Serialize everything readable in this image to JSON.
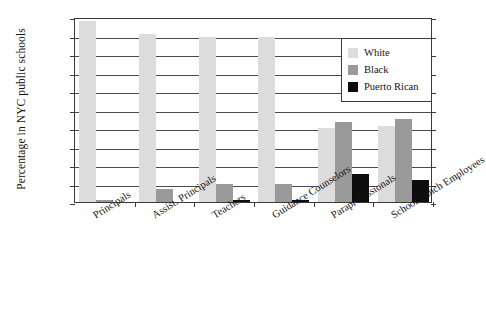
{
  "chart_data": {
    "type": "bar",
    "title": "",
    "xlabel": "",
    "ylabel": "Percentage in NYC public schools",
    "ylim": [
      0,
      100
    ],
    "ytick_labels": [
      "100",
      "90",
      "80",
      "70",
      "60",
      "50",
      "40",
      "30",
      "20",
      "10",
      "0"
    ],
    "ytick_values": [
      100,
      90,
      80,
      70,
      60,
      50,
      40,
      30,
      20,
      10,
      0
    ],
    "grid": true,
    "legend_position": "top-right",
    "categories": [
      "Principals",
      "Assist. Principals",
      "Teachers",
      "Guidance Counselors",
      "Paraprofessionals",
      "School Lunch Employees"
    ],
    "series": [
      {
        "name": "White",
        "color": "#dcdcdc",
        "values": [
          98,
          91,
          89,
          89,
          40,
          41
        ]
      },
      {
        "name": "Black",
        "color": "#9a9a9a",
        "values": [
          1,
          7,
          10,
          10,
          43,
          45
        ]
      },
      {
        "name": "Puerto Rican",
        "color": "#0d0d0d",
        "values": [
          0,
          0,
          1,
          1,
          15,
          12
        ]
      }
    ]
  },
  "legend": {
    "items": [
      {
        "label": "White"
      },
      {
        "label": "Black"
      },
      {
        "label": "Puerto Rican"
      }
    ]
  }
}
